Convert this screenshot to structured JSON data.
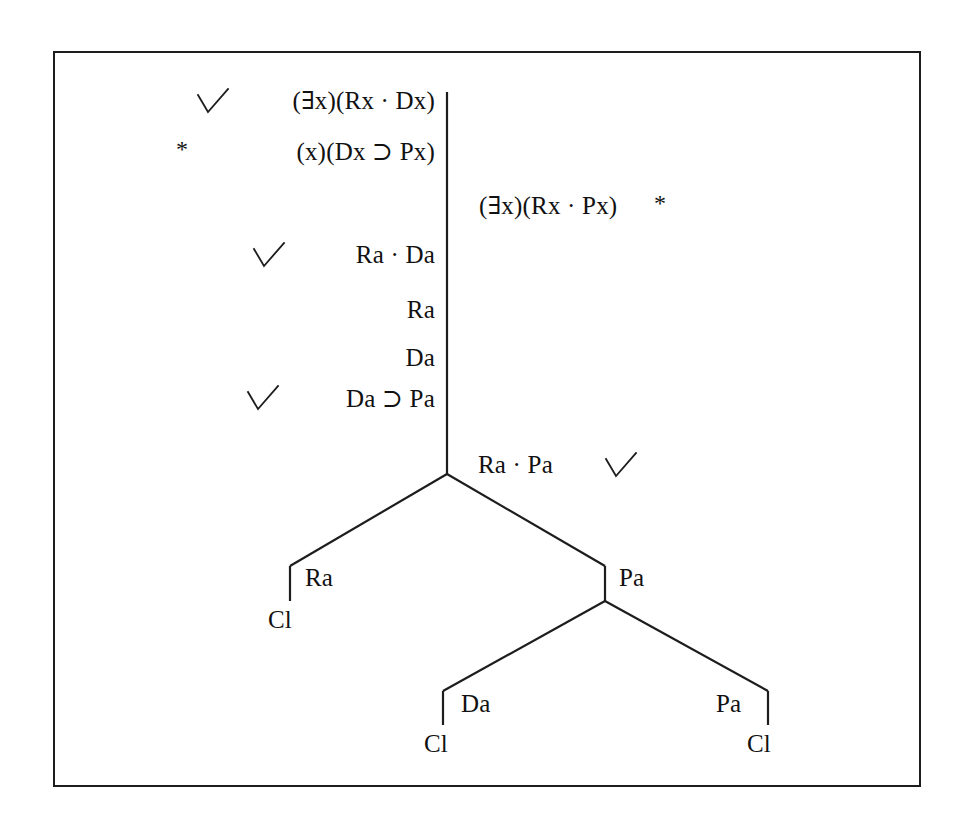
{
  "diagram": {
    "kind": "truth-tree",
    "title": "",
    "frame": {
      "border_color": "#1d1d1d"
    },
    "symbols": {
      "check": "check-mark",
      "star": "*",
      "exists": "∃",
      "dot": "·",
      "horseshoe": "⊃"
    },
    "trunk_lines": [
      {
        "id": "line-1",
        "check": "✓",
        "text": "(∃x)(Rx · Dx)",
        "star": ""
      },
      {
        "id": "line-2",
        "check": "",
        "text": "(x)(Dx ⊃ Px)",
        "star": "*"
      },
      {
        "id": "line-3",
        "check": "✓",
        "text": "Ra · Da",
        "star": ""
      },
      {
        "id": "line-4",
        "check": "",
        "text": "Ra",
        "star": ""
      },
      {
        "id": "line-5",
        "check": "",
        "text": "Da",
        "star": ""
      },
      {
        "id": "line-6",
        "check": "✓",
        "text": "Da ⊃ Pa",
        "star": ""
      }
    ],
    "right_line": {
      "id": "line-right",
      "text": "(∃x)(Rx · Px)",
      "star": "*"
    },
    "branch_root_line": {
      "id": "line-branch-root",
      "text": "Ra · Pa",
      "check": "✓"
    },
    "nodes": [
      {
        "id": "node-ra",
        "label": "Ra",
        "closure": "Cl"
      },
      {
        "id": "node-pa-upper",
        "label": "Pa",
        "closure": ""
      },
      {
        "id": "node-da",
        "label": "Da",
        "closure": "Cl"
      },
      {
        "id": "node-pa-lower",
        "label": "Pa",
        "closure": "Cl"
      }
    ]
  }
}
